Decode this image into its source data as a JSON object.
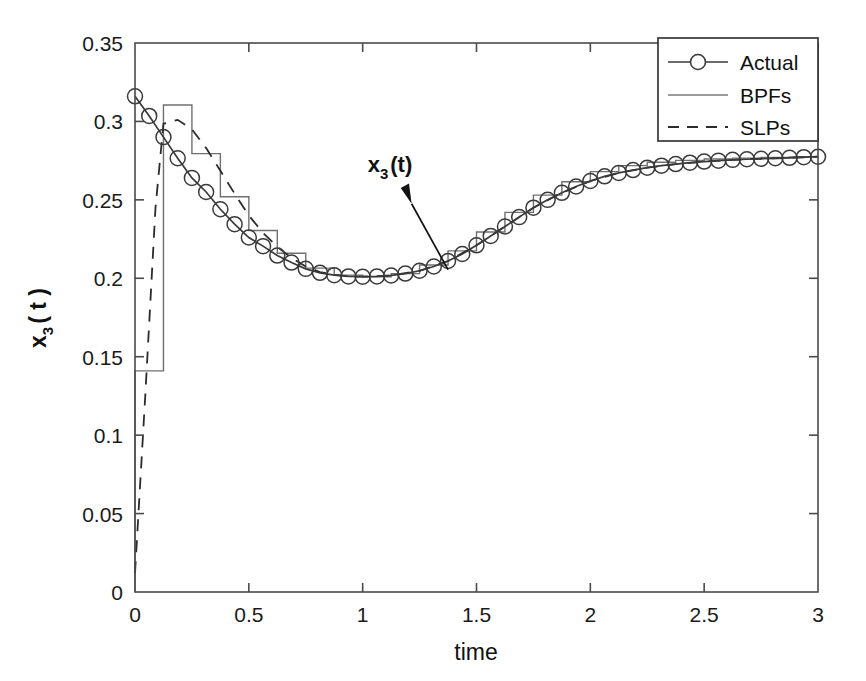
{
  "chart_data": {
    "type": "line",
    "title": "",
    "xlabel": "time",
    "ylabel": "x_3 ( t )",
    "ylabel_base": "x",
    "ylabel_sub": "3",
    "ylabel_tail": "( t )",
    "xlim": [
      0,
      3
    ],
    "ylim": [
      0,
      0.35
    ],
    "xticks": [
      0,
      0.5,
      1,
      1.5,
      2,
      2.5,
      3
    ],
    "xticklabels": [
      "0",
      "0.5",
      "1",
      "1.5",
      "2",
      "2.5",
      "3"
    ],
    "yticks": [
      0,
      0.05,
      0.1,
      0.15,
      0.2,
      0.25,
      0.3,
      0.35
    ],
    "yticklabels": [
      "0",
      "0.05",
      "0.1",
      "0.15",
      "0.2",
      "0.25",
      "0.3",
      "0.35"
    ],
    "grid": false,
    "legend_position": "top-right",
    "legend": [
      "Actual",
      "BPFs",
      "SLPs"
    ],
    "annotations": [
      {
        "text": "x_3(t)",
        "base": "x",
        "sub": "3",
        "tail": "(t)",
        "text_x": 1.12,
        "text_y": 0.268,
        "arrow_from_x": 1.215,
        "arrow_from_y": 0.2475,
        "arrow_to_x": 1.375,
        "arrow_to_y": 0.2055
      }
    ],
    "series": [
      {
        "name": "Actual",
        "style": "solid-with-circle-markers",
        "marker": "o",
        "color": "#3a3a3a",
        "x": [
          0,
          0.0625,
          0.125,
          0.1875,
          0.25,
          0.3125,
          0.375,
          0.4375,
          0.5,
          0.5625,
          0.625,
          0.6875,
          0.75,
          0.8125,
          0.875,
          0.9375,
          1,
          1.0625,
          1.125,
          1.1875,
          1.25,
          1.3125,
          1.375,
          1.4375,
          1.5,
          1.5625,
          1.625,
          1.6875,
          1.75,
          1.8125,
          1.875,
          1.9375,
          2,
          2.0625,
          2.125,
          2.1875,
          2.25,
          2.3125,
          2.375,
          2.4375,
          2.5,
          2.5625,
          2.625,
          2.6875,
          2.75,
          2.8125,
          2.875,
          2.9375,
          3
        ],
        "y": [
          0.316,
          0.3035,
          0.29,
          0.2765,
          0.264,
          0.255,
          0.244,
          0.2345,
          0.226,
          0.2205,
          0.2145,
          0.21,
          0.206,
          0.2035,
          0.202,
          0.2012,
          0.201,
          0.2012,
          0.2018,
          0.203,
          0.2048,
          0.2075,
          0.211,
          0.2155,
          0.221,
          0.227,
          0.233,
          0.239,
          0.245,
          0.25,
          0.2545,
          0.2585,
          0.262,
          0.265,
          0.2672,
          0.269,
          0.2705,
          0.2718,
          0.2728,
          0.2737,
          0.2744,
          0.275,
          0.2755,
          0.2759,
          0.2762,
          0.2765,
          0.2768,
          0.2772,
          0.2775
        ]
      },
      {
        "name": "BPFs",
        "style": "staircase",
        "color": "#707070",
        "step_width": 0.125,
        "step_edges": [
          0,
          0.125,
          0.25,
          0.375,
          0.5,
          0.625,
          0.75,
          0.875,
          1.0,
          1.125,
          1.25,
          1.375,
          1.5,
          1.625,
          1.75,
          1.875,
          2.0,
          2.125,
          2.25,
          2.375,
          2.5,
          2.625,
          2.75,
          2.875,
          3.0
        ],
        "step_values": [
          0.141,
          0.3105,
          0.2795,
          0.252,
          0.2305,
          0.216,
          0.2065,
          0.202,
          0.201,
          0.203,
          0.2085,
          0.2175,
          0.2295,
          0.242,
          0.253,
          0.2615,
          0.268,
          0.2718,
          0.274,
          0.2752,
          0.276,
          0.2766,
          0.277,
          0.2774
        ]
      },
      {
        "name": "SLPs",
        "style": "dashed",
        "color": "#2b2b2b",
        "x": [
          0,
          0.045,
          0.09,
          0.125,
          0.1875,
          0.25,
          0.3125,
          0.375,
          0.4375,
          0.5,
          0.5625,
          0.625,
          0.6875,
          0.75,
          0.8125,
          0.875,
          0.9375,
          1,
          1.125,
          1.25,
          1.375,
          1.5,
          1.625,
          1.75,
          1.875,
          2,
          2.125,
          2.25,
          2.375,
          2.5,
          2.625,
          2.75,
          2.875,
          3
        ],
        "y": [
          0.012,
          0.125,
          0.245,
          0.2985,
          0.301,
          0.295,
          0.283,
          0.2685,
          0.254,
          0.24,
          0.229,
          0.22,
          0.213,
          0.2075,
          0.204,
          0.2022,
          0.2012,
          0.201,
          0.2018,
          0.2048,
          0.211,
          0.221,
          0.233,
          0.245,
          0.2545,
          0.262,
          0.2672,
          0.2705,
          0.2728,
          0.2744,
          0.2755,
          0.2762,
          0.2768,
          0.2775
        ]
      }
    ]
  },
  "legend": {
    "items": [
      {
        "label": "Actual",
        "style": "solid-marker"
      },
      {
        "label": "BPFs",
        "style": "solid-thin"
      },
      {
        "label": "SLPs",
        "style": "dashed"
      }
    ]
  }
}
